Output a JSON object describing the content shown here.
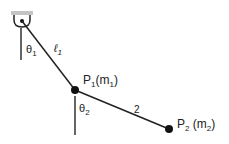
{
  "diagram": {
    "labels": {
      "theta1": {
        "sym": "θ",
        "sub": "1"
      },
      "ell1": {
        "sym": "ℓ",
        "sub": "1"
      },
      "p1": {
        "name": "P",
        "sub": "1",
        "open": "(m",
        "msub": "1",
        "close": ")"
      },
      "theta2": {
        "sym": "θ",
        "sub": "2"
      },
      "ell2": {
        "text": "2"
      },
      "p2": {
        "name": "P",
        "sub": "2",
        "open": " (m",
        "msub": "2",
        "close": ")"
      }
    },
    "colors": {
      "line": "#222222",
      "ceiling": "#bdbdbd",
      "mass": "#111111"
    }
  }
}
